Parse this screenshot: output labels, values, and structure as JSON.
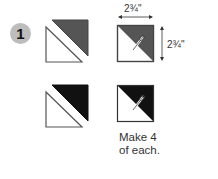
{
  "step": {
    "number": "1"
  },
  "dimensions": {
    "width_label": "2¾\"",
    "height_label": "2¾\""
  },
  "instruction": {
    "line1": "Make 4",
    "line2": "of each."
  },
  "colors": {
    "badge": "#bdbdbd",
    "gray_fabric": "#555555",
    "black_fabric": "#111111",
    "outline": "#444444"
  },
  "blocks": [
    {
      "row": 1,
      "kind": "separated-triangles",
      "fabric": "gray"
    },
    {
      "row": 1,
      "kind": "sewn-square",
      "fabric": "gray",
      "size": "2¾\" x 2¾\""
    },
    {
      "row": 2,
      "kind": "separated-triangles",
      "fabric": "black"
    },
    {
      "row": 2,
      "kind": "sewn-square",
      "fabric": "black"
    }
  ]
}
